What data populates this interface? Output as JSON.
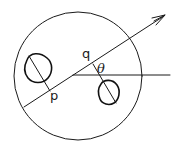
{
  "diagram": {
    "labels": {
      "p": "p",
      "q": "q",
      "theta": "θ"
    },
    "colors": {
      "stroke": "#1a1a1a",
      "background": "#ffffff"
    },
    "elements": {
      "outer_circle": {
        "cx": 78,
        "cy": 76,
        "r": 64
      },
      "directed_line": {
        "x1": 24,
        "y1": 107,
        "x2": 165,
        "y2": 15,
        "arrow": true
      },
      "horizontal_line": {
        "x1": 73,
        "y1": 75,
        "x2": 170,
        "y2": 75
      },
      "left_blob": {
        "cx": 38,
        "cy": 69
      },
      "right_blob": {
        "cx": 109,
        "cy": 93
      },
      "left_perpendicular": {
        "x1": 28,
        "y1": 55,
        "x2": 50,
        "y2": 90
      },
      "right_perpendicular": {
        "x1": 93,
        "y1": 65,
        "x2": 116,
        "y2": 103
      }
    }
  }
}
